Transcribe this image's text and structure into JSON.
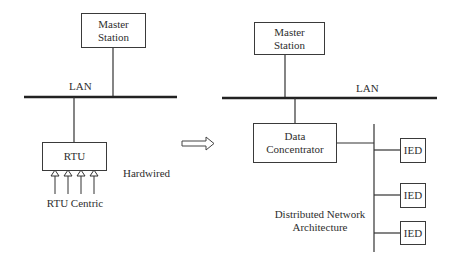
{
  "left": {
    "master_station": {
      "line1": "Master",
      "line2": "Station"
    },
    "lan_label": "LAN",
    "rtu_label": "RTU",
    "hardwired_label": "Hardwired",
    "caption": "RTU Centric",
    "input_arrows": 4
  },
  "transition_arrow": "hollow-right-arrow",
  "right": {
    "master_station": {
      "line1": "Master",
      "line2": "Station"
    },
    "lan_label": "LAN",
    "data_concentrator": {
      "line1": "Data",
      "line2": "Concentrator"
    },
    "ieds": [
      {
        "label": "IED"
      },
      {
        "label": "IED"
      },
      {
        "label": "IED"
      }
    ],
    "caption": {
      "line1": "Distributed Network",
      "line2": "Architecture"
    }
  },
  "colors": {
    "line": "#333333",
    "background": "#ffffff"
  }
}
